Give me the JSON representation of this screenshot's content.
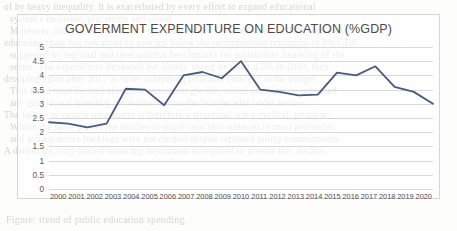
{
  "chart_data": {
    "type": "line",
    "title": "GOVERMENT EXPENDITURE ON EDUCATION (%GDP)",
    "xlabel": "",
    "ylabel": "",
    "ylim": [
      0,
      5
    ],
    "ytick_step": 0.5,
    "grid": true,
    "legend": "none",
    "line_color": "#4a5a7d",
    "categories": [
      "2000",
      "2001",
      "2002",
      "2003",
      "2004",
      "2005",
      "2006",
      "2007",
      "2008",
      "2009",
      "2010",
      "2011",
      "2012",
      "2013",
      "2014",
      "2015",
      "2016",
      "2017",
      "2018",
      "2019",
      "2020"
    ],
    "values": [
      2.35,
      2.3,
      2.17,
      2.3,
      3.53,
      3.5,
      2.95,
      4.0,
      4.12,
      3.9,
      4.5,
      3.5,
      3.42,
      3.3,
      3.32,
      4.1,
      4.0,
      4.32,
      3.6,
      3.42,
      3.0
    ],
    "yticks": [
      "0",
      "0.5",
      "1",
      "1.5",
      "2",
      "2.5",
      "3",
      "3.5",
      "4",
      "4.5",
      "5"
    ]
  },
  "background_text": {
    "lines": [
      "of by heavy inequality. It is exacerbated by every effort to expand educational",
      "system's inclusion, placement and sound",
      "Moreover, analysis of the public expenditure share for education (%GDP) shows that",
      "education share has remained on average below the recommended minimum of 6% GDP",
      "suggested by regional and international benchmarks for sustainable financing of the",
      "sector. The expenditure increased but slowly, rising to about 4.5% in 2010, then",
      "dropping again after 2017 as other competing priorities emerged in the budget.",
      "This trend must be read alongside enrolment growth, which consistently outpaced",
      "any gain in real spending per learner across the two decades under review.",
      "The failure to sustain investment is therefore a structural, not a cyclical, problem.",
      "Within the same period the teacher-to-pupil ratio also widened in most provinces,",
      "and infrastructure backlogs were not cleared despite repeated policy commitments.",
      "A deliberate, ring-fenced financing instrument is required to reverse this decline."
    ],
    "caption": "Figure: trend of public education spending"
  }
}
